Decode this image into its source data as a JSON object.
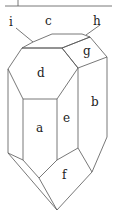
{
  "diagram": {
    "labels": {
      "i": "i",
      "c": "c",
      "h": "h",
      "g": "g",
      "d": "d",
      "a": "a",
      "e": "e",
      "b": "b",
      "f": "f"
    },
    "line_color": "#444444"
  }
}
